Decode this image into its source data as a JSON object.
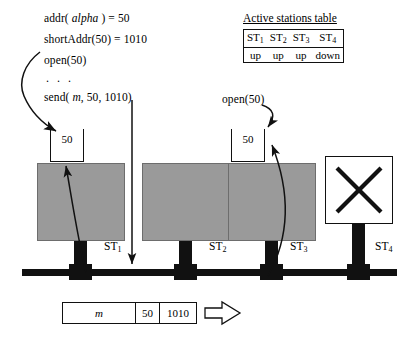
{
  "code": {
    "lines": [
      {
        "id": "addr",
        "pre": "addr( ",
        "italic": "alpha",
        "post": " ) = 50"
      },
      {
        "id": "shortaddr",
        "pre": "shortAddr(50) = 1010",
        "italic": "",
        "post": ""
      },
      {
        "id": "open",
        "pre": "open(50)",
        "italic": "",
        "post": ""
      },
      {
        "id": "ellipsis",
        "pre": ". . .",
        "italic": "",
        "post": ""
      },
      {
        "id": "send",
        "pre": "send( ",
        "italic": "m",
        "post": ", 50, 1010)"
      }
    ]
  },
  "stations_table": {
    "title": "Active stations table",
    "headers": [
      "ST",
      "ST",
      "ST",
      "ST"
    ],
    "header_subs": [
      "1",
      "2",
      "3",
      "4"
    ],
    "states": [
      "up",
      "up",
      "up",
      "down"
    ]
  },
  "open_call_right": {
    "label": "open(50)"
  },
  "stations": [
    {
      "id": "st1",
      "label": "ST",
      "sub": "1",
      "state": "up",
      "buffer": "50"
    },
    {
      "id": "st2",
      "label": "ST",
      "sub": "2",
      "state": "up",
      "buffer": null
    },
    {
      "id": "st3",
      "label": "ST",
      "sub": "3",
      "state": "up",
      "buffer": "50"
    },
    {
      "id": "st4",
      "label": "ST",
      "sub": "4",
      "state": "down",
      "buffer": null
    }
  ],
  "packet": {
    "fields": [
      {
        "name": "body",
        "value": "m",
        "italic": true
      },
      {
        "name": "address",
        "value": "50",
        "italic": false
      },
      {
        "name": "short-address",
        "value": "1010",
        "italic": false
      }
    ]
  },
  "colors": {
    "station_fill": "#9a9a9a",
    "station_border": "#6d6d6d",
    "line": "#111111",
    "background": "#ffffff"
  }
}
